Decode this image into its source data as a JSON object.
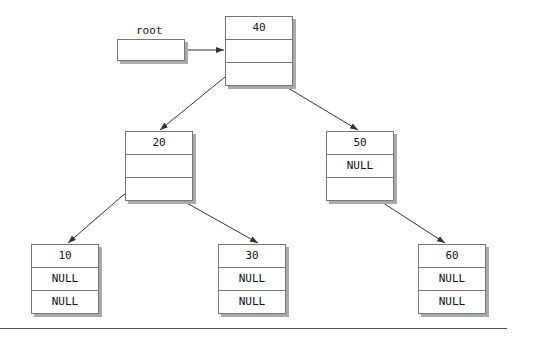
{
  "root": {
    "label": "root"
  },
  "nodes": [
    {
      "id": "n40",
      "cells": [
        "40",
        "",
        ""
      ]
    },
    {
      "id": "n20",
      "cells": [
        "20",
        "",
        ""
      ]
    },
    {
      "id": "n50",
      "cells": [
        "50",
        "NULL",
        ""
      ]
    },
    {
      "id": "n10",
      "cells": [
        "10",
        "NULL",
        "NULL"
      ]
    },
    {
      "id": "n30",
      "cells": [
        "30",
        "NULL",
        "NULL"
      ]
    },
    {
      "id": "n60",
      "cells": [
        "60",
        "NULL",
        "NULL"
      ]
    }
  ],
  "edges": [
    {
      "from": "root",
      "to": "40"
    },
    {
      "from": "40",
      "to": "20",
      "side": "left"
    },
    {
      "from": "40",
      "to": "50",
      "side": "right"
    },
    {
      "from": "20",
      "to": "10",
      "side": "left"
    },
    {
      "from": "20",
      "to": "30",
      "side": "right"
    },
    {
      "from": "50",
      "to": "60",
      "side": "right"
    }
  ]
}
